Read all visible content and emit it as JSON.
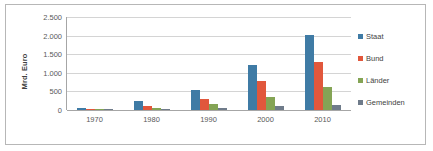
{
  "chart_data": {
    "type": "bar",
    "title": "",
    "subtitle": "",
    "xlabel": "",
    "ylabel": "Mrd. Euro",
    "categories": [
      "1970",
      "1980",
      "1990",
      "2000",
      "2010"
    ],
    "series": [
      {
        "name": "Staat",
        "color": "#3f7ba5",
        "values": [
          52,
          235,
          535,
          1220,
          2020
        ]
      },
      {
        "name": "Bund",
        "color": "#e1573c",
        "values": [
          20,
          105,
          300,
          785,
          1300
        ]
      },
      {
        "name": "Länder",
        "color": "#84a455",
        "values": [
          15,
          60,
          150,
          340,
          610
        ]
      },
      {
        "name": "Gemeinden",
        "color": "#6f7b8a",
        "values": [
          12,
          35,
          65,
          110,
          125
        ]
      }
    ],
    "ylim": [
      0,
      2500
    ],
    "yticks": [
      0,
      500,
      1000,
      1500,
      2000,
      2500
    ],
    "ytick_labels": [
      "0",
      "500",
      "1.000",
      "1.500",
      "2.000",
      "2.500"
    ],
    "grid": true,
    "legend_position": "right",
    "annotations": []
  },
  "legend": {
    "items": [
      {
        "label": "Staat",
        "color": "#3f7ba5"
      },
      {
        "label": "Bund",
        "color": "#e1573c"
      },
      {
        "label": "Länder",
        "color": "#84a455"
      },
      {
        "label": "Gemeinden",
        "color": "#6f7b8a"
      }
    ]
  }
}
